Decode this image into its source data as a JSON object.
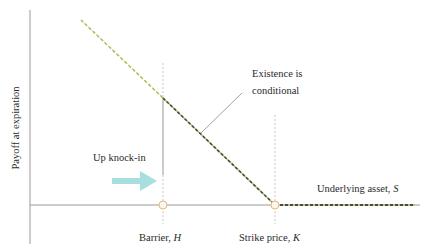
{
  "diagram": {
    "type": "payoff-diagram",
    "y_axis_label": "Payoff at expiration",
    "x_axis": {
      "label_prefix": "Underlying asset, ",
      "label_var": "S"
    },
    "barrier": {
      "label_prefix": "Barrier, ",
      "label_var": "H"
    },
    "strike": {
      "label_prefix": "Strike price, ",
      "label_var": "K"
    },
    "annotation": {
      "line1": "Existence is",
      "line2": "conditional"
    },
    "knock_label": "Up knock-in",
    "colors": {
      "axis": "#9a9a9a",
      "payoff_dash_light": "#a8c94e",
      "payoff_dash_dark": "#555555",
      "arrow": "#a8dede",
      "marker_fill": "#fff7ea",
      "marker_stroke": "#e0b98a",
      "guide": "#b8b8b8"
    }
  }
}
